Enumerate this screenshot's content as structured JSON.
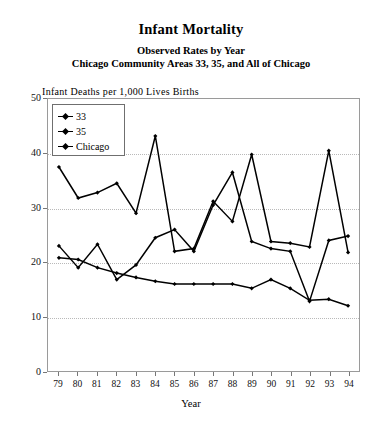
{
  "title": {
    "main": "Infant Mortality",
    "sub1": "Observed Rates by Year",
    "sub2": "Chicago Community Areas 33, 35, and All of Chicago"
  },
  "axes": {
    "ylabel": "Infant Deaths per 1,000 Lives Births",
    "xlabel": "Year",
    "y_ticks": [
      "0",
      "10",
      "20",
      "30",
      "40",
      "50"
    ],
    "x_ticks": [
      "79",
      "80",
      "81",
      "82",
      "83",
      "84",
      "85",
      "86",
      "87",
      "88",
      "89",
      "90",
      "91",
      "92",
      "93",
      "94"
    ]
  },
  "legend": {
    "position": "top-left-inside",
    "entries": [
      {
        "label": "33",
        "marker": "diamond-marker-icon"
      },
      {
        "label": "35",
        "marker": "diamond-marker-icon"
      },
      {
        "label": "Chicago",
        "marker": "diamond-marker-icon"
      }
    ]
  },
  "chart_data": {
    "type": "line",
    "title": "Infant Mortality",
    "subtitle": "Observed Rates by Year — Chicago Community Areas 33, 35, and All of Chicago",
    "xlabel": "Year",
    "ylabel": "Infant Deaths per 1,000 Lives Births",
    "x": [
      79,
      80,
      81,
      82,
      83,
      84,
      85,
      86,
      87,
      88,
      89,
      90,
      91,
      92,
      93,
      94
    ],
    "categories": [
      "79",
      "80",
      "81",
      "82",
      "83",
      "84",
      "85",
      "86",
      "87",
      "88",
      "89",
      "90",
      "91",
      "92",
      "93",
      "94"
    ],
    "ylim": [
      0,
      50
    ],
    "xlim": [
      79,
      94
    ],
    "grid": true,
    "legend": [
      "33",
      "35",
      "Chicago"
    ],
    "series": [
      {
        "name": "33",
        "color": "#000000",
        "values": [
          37.5,
          31.8,
          32.8,
          34.5,
          29.0,
          43.2,
          22.0,
          22.5,
          31.2,
          27.5,
          39.8,
          23.8,
          23.5,
          22.8,
          40.5,
          21.8
        ]
      },
      {
        "name": "35",
        "color": "#000000",
        "values": [
          23.0,
          19.0,
          23.3,
          16.8,
          19.5,
          24.5,
          26.0,
          22.0,
          30.5,
          36.5,
          23.8,
          22.5,
          22.0,
          12.8,
          24.0,
          24.8
        ]
      },
      {
        "name": "Chicago",
        "color": "#000000",
        "values": [
          20.8,
          20.5,
          19.0,
          18.0,
          17.2,
          16.5,
          16.0,
          16.0,
          16.0,
          16.0,
          15.2,
          16.8,
          15.2,
          13.0,
          13.2,
          12.0
        ]
      }
    ]
  }
}
